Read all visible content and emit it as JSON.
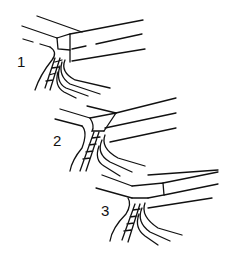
{
  "figure": {
    "type": "line-drawing",
    "panels": [
      {
        "label": "1"
      },
      {
        "label": "2"
      },
      {
        "label": "3"
      }
    ],
    "colors": {
      "stroke": "#111111",
      "background": "#ffffff"
    }
  }
}
